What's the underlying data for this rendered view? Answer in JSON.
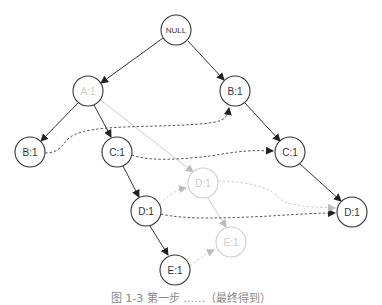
{
  "diagram": {
    "type": "fp-tree",
    "nodes": [
      {
        "id": "null",
        "label": "NULL",
        "x": 176,
        "y": 30,
        "style": "normal"
      },
      {
        "id": "a1",
        "label": "A:1",
        "x": 88,
        "y": 91,
        "style": "ghost-label"
      },
      {
        "id": "b1r",
        "label": "B:1",
        "x": 235,
        "y": 91,
        "style": "normal"
      },
      {
        "id": "b1l",
        "label": "B:1",
        "x": 30,
        "y": 152,
        "style": "normal"
      },
      {
        "id": "c1m",
        "label": "C:1",
        "x": 117,
        "y": 152,
        "style": "normal"
      },
      {
        "id": "c1r",
        "label": "C:1",
        "x": 290,
        "y": 152,
        "style": "normal"
      },
      {
        "id": "d1g",
        "label": "D:1",
        "x": 203,
        "y": 183,
        "style": "ghost"
      },
      {
        "id": "d1m",
        "label": "D:1",
        "x": 146,
        "y": 211,
        "style": "normal"
      },
      {
        "id": "d1r",
        "label": "D:1",
        "x": 352,
        "y": 212,
        "style": "normal"
      },
      {
        "id": "e1g",
        "label": "E:1",
        "x": 231,
        "y": 242,
        "style": "ghost"
      },
      {
        "id": "e1m",
        "label": "E:1",
        "x": 175,
        "y": 270,
        "style": "normal"
      }
    ],
    "tree_edges": [
      {
        "from": "null",
        "to": "a1"
      },
      {
        "from": "null",
        "to": "b1r"
      },
      {
        "from": "a1",
        "to": "b1l"
      },
      {
        "from": "a1",
        "to": "c1m"
      },
      {
        "from": "b1r",
        "to": "c1r"
      },
      {
        "from": "c1m",
        "to": "d1m"
      },
      {
        "from": "c1r",
        "to": "d1r"
      },
      {
        "from": "d1m",
        "to": "e1m"
      }
    ],
    "ghost_edges": [
      {
        "from": "a1",
        "to": "d1g"
      },
      {
        "from": "d1g",
        "to": "e1g"
      }
    ],
    "node_links_dark": [
      {
        "from": "b1l",
        "to": "b1r"
      },
      {
        "from": "c1m",
        "to": "c1r"
      },
      {
        "from": "d1m",
        "to": "d1r"
      }
    ],
    "node_links_light": [
      {
        "from": "d1m",
        "to": "d1g"
      },
      {
        "from": "d1g",
        "to": "d1r"
      },
      {
        "from": "e1m",
        "to": "e1g"
      }
    ]
  },
  "labels": {
    "null": "NULL",
    "a1": "A:1",
    "b1r": "B:1",
    "b1l": "B:1",
    "c1m": "C:1",
    "c1r": "C:1",
    "d1g": "D:1",
    "d1m": "D:1",
    "d1r": "D:1",
    "e1g": "E:1",
    "e1m": "E:1"
  },
  "caption": "图 1-3  第一步 ……（最终得到）",
  "colors": {
    "stroke": "#333333",
    "ghost": "#cccccc",
    "link_dark": "#555555",
    "background": "#ffffff"
  }
}
